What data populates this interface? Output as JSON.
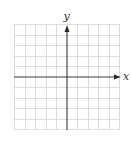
{
  "diagram": {
    "type": "coordinate-grid",
    "grid": {
      "columns": 10,
      "rows": 10,
      "line_color": "#d9d9d9",
      "axis_color": "#444444"
    },
    "axes": {
      "x_label": "x",
      "y_label": "y"
    }
  }
}
